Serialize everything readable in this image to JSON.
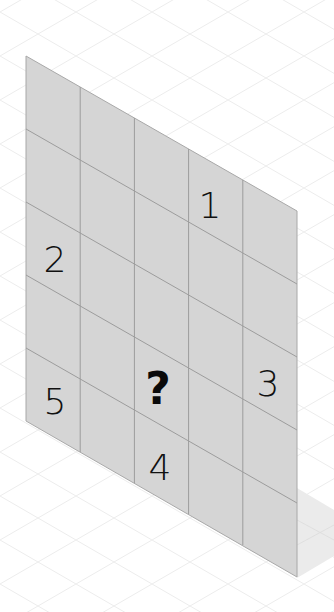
{
  "puzzle": {
    "type": "isometric number grid",
    "rows": 5,
    "cols": 5,
    "cells": [
      {
        "row": 0,
        "col": 3,
        "value": "1"
      },
      {
        "row": 2,
        "col": 0,
        "value": "2"
      },
      {
        "row": 2,
        "col": 4,
        "value": "3"
      },
      {
        "row": 3,
        "col": 2,
        "value": "?"
      },
      {
        "row": 4,
        "col": 0,
        "value": "5"
      },
      {
        "row": 4,
        "col": 2,
        "value": "4"
      }
    ],
    "labels": {
      "one": "1",
      "two": "2",
      "three": "3",
      "question": "?",
      "four": "4",
      "five": "5"
    }
  },
  "colors": {
    "background": "#ffffff",
    "background_grid": "#ececec",
    "panel_fill": "#d5d5d5",
    "panel_lines": "#9c9c9c",
    "shadow": "#ebebeb",
    "text": "#111111"
  }
}
